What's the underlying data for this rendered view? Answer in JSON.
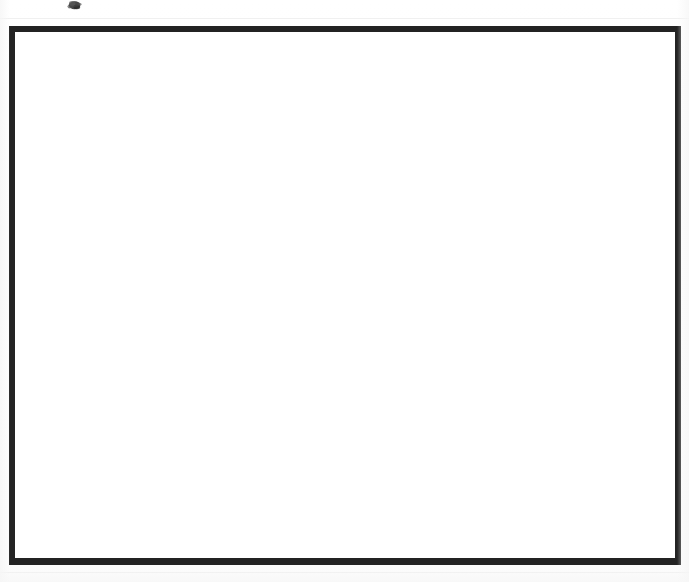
{
  "document": {
    "kind": "scanned-blank-grid-sheet",
    "title": "Blank grid sheet",
    "page_width": 689,
    "page_height": 582,
    "background_color": "#ffffff"
  },
  "frame": {
    "name": "heavy ruled border rectangle",
    "color": "#232323",
    "left": 9,
    "top": 26,
    "width": 672,
    "height": 539,
    "border_top": 6,
    "border_left": 6,
    "border_right": 6,
    "border_bottom": 7
  },
  "grid": {
    "name": "interior ruling",
    "line_color": "#b9b9b9",
    "line_width": 1,
    "columns": 30,
    "rows": 24,
    "cell_width": 22,
    "cell_height": 21.95,
    "surface_left": 15,
    "surface_top": 32,
    "surface_width": 660,
    "surface_height": 527,
    "cell_fill": "#ffffff"
  },
  "artifacts": {
    "ink_smudge": {
      "name": "ink smudge",
      "color": "#3a3a3a",
      "left": 64,
      "top": 0,
      "width": 20,
      "height": 12
    },
    "scan_streaks": [
      {
        "name": "top streak",
        "top": 18,
        "color": "#f0f0f0"
      },
      {
        "name": "bottom streak",
        "top": 572,
        "color": "#f0f0f0"
      }
    ]
  }
}
